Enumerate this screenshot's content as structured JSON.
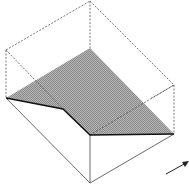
{
  "diagram": {
    "colors": {
      "background": "#ffffff",
      "plane_fill": "#a8a8a8",
      "edge": "#333333",
      "dashed_edge": "#555555"
    },
    "vertices": {
      "top": [
        90,
        1
      ],
      "left_top": [
        6,
        50
      ],
      "right_top": [
        174,
        85
      ],
      "left_mid": [
        6,
        98
      ],
      "crease": [
        63,
        109
      ],
      "front_mid": [
        90,
        135
      ],
      "right_mid": [
        174,
        134
      ],
      "bottom": [
        90,
        183
      ],
      "plane_apex": [
        90,
        48
      ]
    },
    "arrow": {
      "from": [
        166,
        174
      ],
      "to": [
        188,
        162
      ]
    }
  }
}
